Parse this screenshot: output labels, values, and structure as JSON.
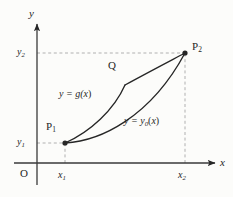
{
  "figure": {
    "kind": "math-diagram",
    "background_color": "#fcfcfa",
    "ink_color": "#262626",
    "guide_color": "#a8a8a8"
  },
  "axes": {
    "y_label": "y",
    "x_label": "x",
    "origin_label": "O",
    "x_axis_y_px": 163,
    "y_axis_x_px": 37,
    "arrowheads": true
  },
  "ticks": {
    "y": [
      {
        "name": "y1-tick",
        "base": "y",
        "sub": "1",
        "value_px": 143
      },
      {
        "name": "y2-tick",
        "base": "y",
        "sub": "2",
        "value_px": 53
      }
    ],
    "x": [
      {
        "name": "x1-tick",
        "base": "x",
        "sub": "1",
        "value_px": 65
      },
      {
        "name": "x2-tick",
        "base": "x",
        "sub": "2",
        "value_px": 185
      }
    ]
  },
  "points": [
    {
      "name": "P1",
      "base": "P",
      "sub": "1",
      "x": 65,
      "y": 143
    },
    {
      "name": "P2",
      "base": "P",
      "sub": "2",
      "x": 185,
      "y": 53
    },
    {
      "name": "Q",
      "base": "Q",
      "sub": "",
      "x": 125,
      "y": 85
    }
  ],
  "curves": [
    {
      "id": "curve-g",
      "label_base": "y = g(",
      "label_var": "x",
      "label_tail": ")",
      "label_sub": "",
      "description": "upper varied curve with a corner at Q"
    },
    {
      "id": "curve-y0",
      "label_base": "y = y",
      "label_sub": "0",
      "label_var": "x",
      "label_tail": ")",
      "label_open": "(",
      "description": "lower extremal curve, smooth and concave up"
    }
  ],
  "guides": {
    "dashed": true,
    "y1_horizontal": "from y-axis to P1",
    "y2_horizontal": "from y-axis to P2",
    "x1_vertical": "from x-axis to P1",
    "x2_vertical": "from x-axis to P2"
  }
}
